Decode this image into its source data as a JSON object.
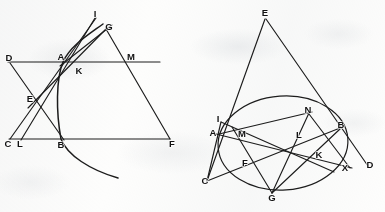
{
  "meta": {
    "background_color": "#fdfdfc",
    "ink_color": "#1c1c1c",
    "width": 385,
    "height": 212
  },
  "figures": [
    {
      "id": "left-figure",
      "name": "left-construction-triangle-with-conic-arc",
      "caption": "",
      "points": [
        {
          "label": "I",
          "x": 95,
          "y": 16,
          "lx": 95,
          "ly": 14
        },
        {
          "label": "G",
          "x": 107,
          "y": 30,
          "lx": 109,
          "ly": 27
        },
        {
          "label": "D",
          "x": 10,
          "y": 62,
          "lx": 9,
          "ly": 58
        },
        {
          "label": "A",
          "x": 63,
          "y": 62,
          "lx": 61,
          "ly": 57
        },
        {
          "label": "M",
          "x": 131,
          "y": 62,
          "lx": 131,
          "ly": 57
        },
        {
          "label": "K",
          "x": 79,
          "y": 70,
          "lx": 79,
          "ly": 71
        },
        {
          "label": "E",
          "x": 33,
          "y": 100,
          "lx": 30,
          "ly": 99
        },
        {
          "label": "C",
          "x": 10,
          "y": 139,
          "lx": 8,
          "ly": 144
        },
        {
          "label": "L",
          "x": 21,
          "y": 139,
          "lx": 20,
          "ly": 144
        },
        {
          "label": "B",
          "x": 61,
          "y": 139,
          "lx": 61,
          "ly": 145
        },
        {
          "label": "F",
          "x": 170,
          "y": 139,
          "lx": 172,
          "ly": 144
        }
      ],
      "segments": [
        {
          "name": "line-D-M",
          "from": "D",
          "to": "M",
          "x1": 8,
          "y1": 62,
          "x2": 160,
          "y2": 62
        },
        {
          "name": "line-C-F",
          "from": "C",
          "to": "F",
          "x1": 9,
          "y1": 139,
          "x2": 170,
          "y2": 139
        },
        {
          "name": "line-D-B",
          "from": "D",
          "to": "B",
          "x1": 10,
          "y1": 63,
          "x2": 64,
          "y2": 140
        },
        {
          "name": "line-I-L",
          "from": "I",
          "to": "L",
          "x1": 95,
          "y1": 18,
          "x2": 21,
          "y2": 140
        },
        {
          "name": "line-I-C",
          "from": "I",
          "to": "C",
          "x1": 96,
          "y1": 18,
          "x2": 10,
          "y2": 139
        },
        {
          "name": "line-G-F",
          "from": "G",
          "to": "F",
          "x1": 106,
          "y1": 29,
          "x2": 170,
          "y2": 139
        },
        {
          "name": "line-G-E",
          "from": "G",
          "to": "E",
          "x1": 107,
          "y1": 28,
          "x2": 28,
          "y2": 108
        },
        {
          "name": "line-G-A-tail",
          "from": "G",
          "to": "A",
          "x1": 112,
          "y1": 25,
          "x2": 60,
          "y2": 66
        }
      ],
      "curve": {
        "name": "conic-arc-through-A-B",
        "path": "M 103,24 C 88,35 70,46 63,62 C 56,79 56,112 61,139 C 67,155 90,170 118,178"
      }
    },
    {
      "id": "right-figure",
      "name": "right-construction-ellipse-with-inscribed-points",
      "caption": "",
      "ellipse": {
        "name": "circumscribing-ellipse",
        "cx": 283,
        "cy": 143,
        "rx": 65,
        "ry": 47,
        "rotation": -4
      },
      "points": [
        {
          "label": "E",
          "x": 265,
          "y": 17,
          "lx": 265,
          "ly": 13
        },
        {
          "label": "N",
          "x": 309,
          "y": 113,
          "lx": 308,
          "ly": 110
        },
        {
          "label": "I",
          "x": 221,
          "y": 122,
          "lx": 218,
          "ly": 119
        },
        {
          "label": "B",
          "x": 339,
          "y": 128,
          "lx": 341,
          "ly": 125
        },
        {
          "label": "A",
          "x": 219,
          "y": 134,
          "lx": 213,
          "ly": 133
        },
        {
          "label": "M",
          "x": 244,
          "y": 136,
          "lx": 242,
          "ly": 134
        },
        {
          "label": "L",
          "x": 300,
          "y": 137,
          "lx": 299,
          "ly": 135
        },
        {
          "label": "K",
          "x": 320,
          "y": 155,
          "lx": 319,
          "ly": 155
        },
        {
          "label": "F",
          "x": 247,
          "y": 163,
          "lx": 245,
          "ly": 163
        },
        {
          "label": "X",
          "x": 345,
          "y": 167,
          "lx": 345,
          "ly": 168
        },
        {
          "label": "D",
          "x": 368,
          "y": 166,
          "lx": 370,
          "ly": 165
        },
        {
          "label": "C",
          "x": 208,
          "y": 180,
          "lx": 205,
          "ly": 181
        },
        {
          "label": "G",
          "x": 272,
          "y": 192,
          "lx": 272,
          "ly": 198
        }
      ],
      "segments": [
        {
          "name": "line-E-C",
          "from": "E",
          "to": "C",
          "x1": 265,
          "y1": 19,
          "x2": 207,
          "y2": 181
        },
        {
          "name": "line-E-D",
          "from": "E",
          "to": "D",
          "x1": 266,
          "y1": 19,
          "x2": 368,
          "y2": 166
        },
        {
          "name": "line-C-B",
          "from": "C",
          "to": "B",
          "x1": 207,
          "y1": 181,
          "x2": 340,
          "y2": 128
        },
        {
          "name": "line-A-X",
          "from": "A",
          "to": "X",
          "x1": 216,
          "y1": 134,
          "x2": 352,
          "y2": 168
        },
        {
          "name": "line-N-G",
          "from": "N",
          "to": "G",
          "x1": 309,
          "y1": 113,
          "x2": 272,
          "y2": 193
        },
        {
          "name": "line-N-X",
          "from": "N",
          "to": "X",
          "x1": 309,
          "y1": 114,
          "x2": 350,
          "y2": 168
        },
        {
          "name": "line-M-G",
          "from": "M",
          "to": "G",
          "x1": 232,
          "y1": 127,
          "x2": 272,
          "y2": 193
        },
        {
          "name": "line-I-K",
          "from": "I",
          "to": "K",
          "x1": 221,
          "y1": 122,
          "x2": 334,
          "y2": 172
        },
        {
          "name": "line-A-N",
          "from": "A",
          "to": "N",
          "x1": 219,
          "y1": 134,
          "x2": 312,
          "y2": 112
        },
        {
          "name": "line-B-G",
          "from": "B",
          "to": "G",
          "x1": 340,
          "y1": 129,
          "x2": 272,
          "y2": 193
        },
        {
          "name": "line-I-C",
          "from": "I",
          "to": "C",
          "x1": 221,
          "y1": 122,
          "x2": 207,
          "y2": 181
        }
      ]
    }
  ]
}
